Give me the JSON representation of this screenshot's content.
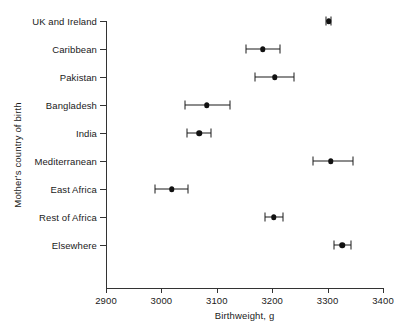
{
  "chart_data": {
    "type": "scatter",
    "title": "",
    "xlabel": "Birthweight, g",
    "ylabel": "Mother's country of birth",
    "xlim": [
      2900,
      3400
    ],
    "xticks": [
      2900,
      3000,
      3100,
      3200,
      3300,
      3400
    ],
    "xtick_labels": [
      "2900",
      "3000",
      "3100",
      "3200",
      "3300",
      "3400"
    ],
    "grid": false,
    "legend": "none",
    "orientation": "horizontal",
    "marker": "filled-circle",
    "error_bars": "horizontal-capped",
    "categories": [
      "UK and Ireland",
      "Caribbean",
      "Pakistan",
      "Bangladesh",
      "India",
      "Mediterranean",
      "East Africa",
      "Rest of Africa",
      "Elsewhere"
    ],
    "values": [
      3302,
      3183,
      3205,
      3082,
      3068,
      3306,
      3019,
      3203,
      3326
    ],
    "ci_low": [
      3298,
      3152,
      3169,
      3043,
      3046,
      3274,
      2988,
      3187,
      3311
    ],
    "ci_high": [
      3306,
      3214,
      3239,
      3124,
      3090,
      3346,
      3048,
      3219,
      3342
    ],
    "points": [
      {
        "category": "UK and Ireland",
        "value": 3302,
        "low": 3298,
        "high": 3306
      },
      {
        "category": "Caribbean",
        "value": 3183,
        "low": 3152,
        "high": 3214
      },
      {
        "category": "Pakistan",
        "value": 3205,
        "low": 3169,
        "high": 3239
      },
      {
        "category": "Bangladesh",
        "value": 3082,
        "low": 3043,
        "high": 3124
      },
      {
        "category": "India",
        "value": 3068,
        "low": 3046,
        "high": 3090
      },
      {
        "category": "Mediterranean",
        "value": 3306,
        "low": 3274,
        "high": 3346
      },
      {
        "category": "East Africa",
        "value": 3019,
        "low": 2988,
        "high": 3048
      },
      {
        "category": "Rest of Africa",
        "value": 3203,
        "low": 3187,
        "high": 3219
      },
      {
        "category": "Elsewhere",
        "value": 3326,
        "low": 3311,
        "high": 3342
      }
    ],
    "colors": {
      "marker": "#111111",
      "error_bar": "#1a1a1a",
      "axis": "#333333",
      "text": "#1a1a1a",
      "background": "#ffffff"
    }
  }
}
